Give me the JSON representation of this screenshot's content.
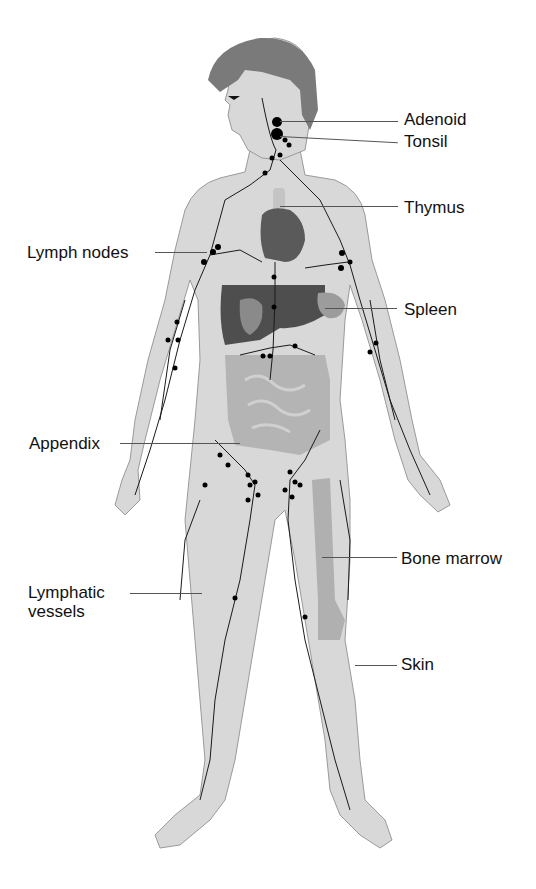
{
  "diagram": {
    "colors": {
      "skin": "#d8d8d8",
      "skin_outline": "#9a9a9a",
      "hair": "#7a7a7a",
      "heart": "#5a5a5a",
      "liver": "#4e4e4e",
      "stomach": "#8a8a8a",
      "spleen": "#9c9c9c",
      "intestine": "#b4b4b4",
      "bone_marrow": "#b0b0b0",
      "thymus": "#c4c4c4",
      "vessels": "#1a1a1a",
      "nodes": "#000000"
    },
    "labels": {
      "adenoid": "Adenoid",
      "tonsil": "Tonsil",
      "thymus": "Thymus",
      "lymph_nodes": "Lymph nodes",
      "spleen": "Spleen",
      "appendix": "Appendix",
      "bone_marrow": "Bone marrow",
      "lymphatic_vessels_line1": "Lymphatic",
      "lymphatic_vessels_line2": "vessels",
      "skin": "Skin"
    }
  }
}
